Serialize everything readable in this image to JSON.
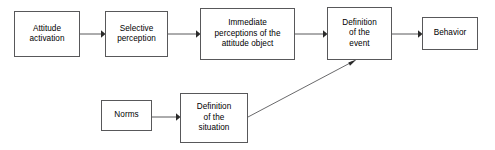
{
  "diagram": {
    "type": "flowchart",
    "title": "",
    "background_color": "#ffffff",
    "stroke_color": "#58585a",
    "text_color": "#000000",
    "nodes": [
      {
        "id": "attitude-activation",
        "label": "Attitude\nactivation",
        "x": 14,
        "y": 11,
        "w": 66,
        "h": 46
      },
      {
        "id": "selective-perception",
        "label": "Selective\nperception",
        "x": 105,
        "y": 11,
        "w": 63,
        "h": 46
      },
      {
        "id": "immediate-perceptions",
        "label": "Immediate\nperceptions of the\nattitude object",
        "x": 200,
        "y": 8,
        "w": 95,
        "h": 52
      },
      {
        "id": "definition-of-the-event",
        "label": "Definition\nof the\nevent",
        "x": 327,
        "y": 7,
        "w": 65,
        "h": 53
      },
      {
        "id": "behavior",
        "label": "Behavior",
        "x": 422,
        "y": 17,
        "w": 56,
        "h": 33
      },
      {
        "id": "norms",
        "label": "Norms",
        "x": 101,
        "y": 100,
        "w": 51,
        "h": 31
      },
      {
        "id": "definition-of-the-situation",
        "label": "Definition\nof the\nsituation",
        "x": 180,
        "y": 93,
        "w": 68,
        "h": 50
      }
    ],
    "edges": [
      {
        "id": "attitude-to-selective",
        "from": "attitude-activation",
        "to": "selective-perception",
        "kind": "straight-horizontal",
        "path": "M 80 34 L 102 34",
        "arrow_x": 104,
        "arrow_y": 34,
        "arrow_dir": "right"
      },
      {
        "id": "selective-to-immediate",
        "from": "selective-perception",
        "to": "immediate-perceptions",
        "kind": "straight-horizontal",
        "path": "M 168 34 L 197 34",
        "arrow_x": 199,
        "arrow_y": 34,
        "arrow_dir": "right"
      },
      {
        "id": "immediate-to-event",
        "from": "immediate-perceptions",
        "to": "definition-of-the-event",
        "kind": "straight-horizontal",
        "path": "M 295 34 L 324 34",
        "arrow_x": 326,
        "arrow_y": 34,
        "arrow_dir": "right"
      },
      {
        "id": "event-to-behavior",
        "from": "definition-of-the-event",
        "to": "behavior",
        "kind": "straight-horizontal",
        "path": "M 392 34 L 419 34",
        "arrow_x": 421,
        "arrow_y": 34,
        "arrow_dir": "right"
      },
      {
        "id": "norms-to-situation",
        "from": "norms",
        "to": "definition-of-the-situation",
        "kind": "straight-horizontal",
        "path": "M 152 117 L 177 117",
        "arrow_x": 179,
        "arrow_y": 117,
        "arrow_dir": "right"
      },
      {
        "id": "situation-to-event",
        "from": "definition-of-the-situation",
        "to": "definition-of-the-event",
        "kind": "diagonal",
        "path": "M 248 117 L 354 61",
        "arrow_x": 356,
        "arrow_y": 60,
        "arrow_dir": "up-right"
      }
    ]
  }
}
